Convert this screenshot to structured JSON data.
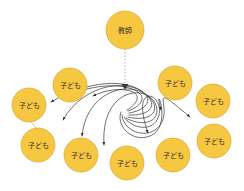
{
  "diagram": {
    "type": "radial-spiral-influence-diagram",
    "title": "",
    "background_color": "#ffffff",
    "node_style": {
      "fill": "#f6c842",
      "stroke": "#d9a52f",
      "label_color": "#3a3228"
    },
    "edge_style": {
      "curve_color": "#3f3f3f",
      "dotted_color": "#8c8c8c",
      "link_color": "#d9a52f"
    },
    "spiral_center": {
      "x": 125,
      "y": 111
    },
    "teacher_node": {
      "id": "teacher",
      "label": "教師",
      "cx": 125,
      "cy": 30,
      "r": 19
    },
    "child_nodes": [
      {
        "id": "child-1",
        "label": "子ども",
        "cx": 70,
        "cy": 85,
        "r": 17
      },
      {
        "id": "child-2",
        "label": "子ども",
        "cx": 29,
        "cy": 105,
        "r": 17
      },
      {
        "id": "child-3",
        "label": "子ども",
        "cx": 38,
        "cy": 145,
        "r": 17
      },
      {
        "id": "child-4",
        "label": "子ども",
        "cx": 81,
        "cy": 155,
        "r": 17
      },
      {
        "id": "child-5",
        "label": "子ども",
        "cx": 127,
        "cy": 163,
        "r": 17
      },
      {
        "id": "child-6",
        "label": "子ども",
        "cx": 173,
        "cy": 155,
        "r": 17
      },
      {
        "id": "child-7",
        "label": "子ども",
        "cx": 214,
        "cy": 141,
        "r": 17
      },
      {
        "id": "child-8",
        "label": "子ども",
        "cx": 213,
        "cy": 101,
        "r": 17
      },
      {
        "id": "child-9",
        "label": "子ども",
        "cx": 175,
        "cy": 83,
        "r": 17
      }
    ],
    "dotted_edge": {
      "id": "teacher-to-center",
      "from": "teacher",
      "to": "spiral_center",
      "style": "dotted",
      "arrowhead": true
    },
    "straight_link": {
      "id": "child2-to-child3",
      "from": "child-2",
      "to": "child-3",
      "style": "solid-thin"
    },
    "spiral_arrow_count": 9
  }
}
